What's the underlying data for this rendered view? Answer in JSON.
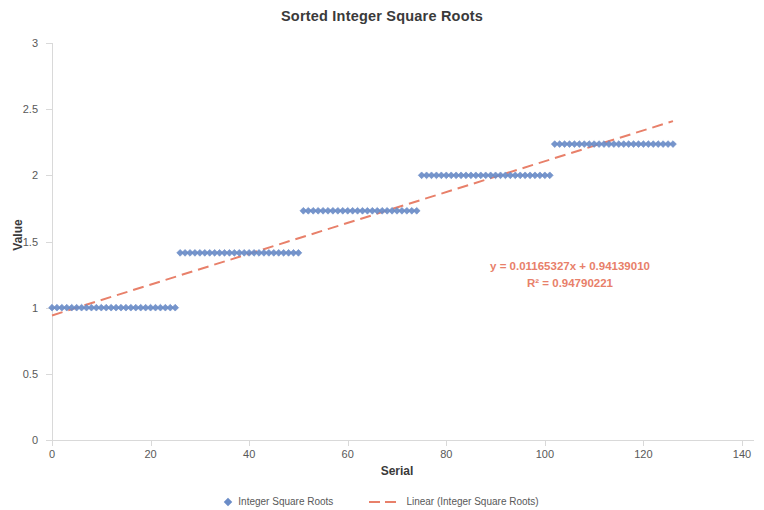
{
  "chart_data": {
    "type": "scatter",
    "title": "Sorted Integer Square Roots",
    "xlabel": "Serial",
    "ylabel": "Value",
    "xlim": [
      0,
      140
    ],
    "ylim": [
      0,
      3
    ],
    "grid": false,
    "legend_position": "bottom",
    "x_ticks": [
      "0",
      "20",
      "40",
      "60",
      "80",
      "100",
      "120",
      "140"
    ],
    "y_ticks": [
      "0",
      "0.5",
      "1",
      "1.5",
      "2",
      "2.5",
      "3"
    ],
    "marker_color": "#6A8CC7",
    "trendline_color": "#E8806A",
    "annotations": {
      "equation": "y = 0.01165327x + 0.94139010",
      "r_squared": "R² = 0.94790221"
    },
    "trendline": {
      "slope": 0.01165327,
      "intercept": 0.9413901,
      "r2": 0.94790221,
      "x_start": 0,
      "x_end": 126
    },
    "series": [
      {
        "name": "Integer Square Roots",
        "plateaus": [
          {
            "value": 1.0,
            "x_start": 0,
            "x_end": 25
          },
          {
            "value": 1.41421,
            "x_start": 26,
            "x_end": 50
          },
          {
            "value": 1.73205,
            "x_start": 51,
            "x_end": 74
          },
          {
            "value": 2.0,
            "x_start": 75,
            "x_end": 101
          },
          {
            "value": 2.23607,
            "x_start": 102,
            "x_end": 126
          }
        ]
      }
    ],
    "legend": [
      {
        "label": "Integer Square Roots",
        "type": "marker"
      },
      {
        "label": "Linear (Integer Square Roots)",
        "type": "dashed-line"
      }
    ]
  }
}
